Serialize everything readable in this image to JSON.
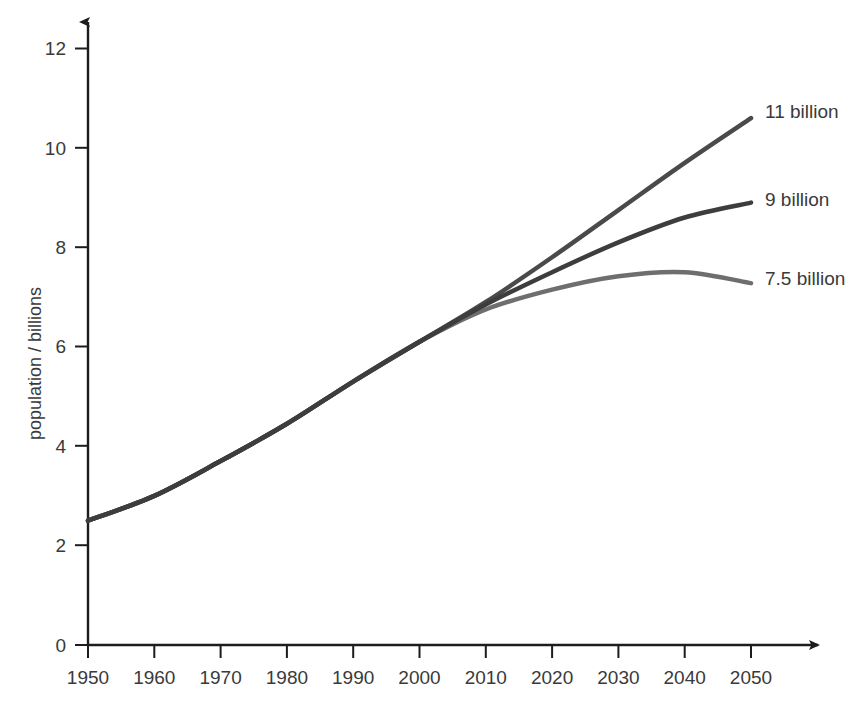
{
  "chart_data": {
    "type": "line",
    "title": "",
    "subtitle": "",
    "xlabel": "",
    "ylabel": "population / billions",
    "xlim": [
      1950,
      2050
    ],
    "ylim": [
      0,
      12
    ],
    "grid": false,
    "legend_position": "right-end-labels",
    "x_ticks": [
      "1950",
      "1960",
      "1970",
      "1980",
      "1990",
      "2000",
      "2010",
      "2020",
      "2030",
      "2040",
      "2050"
    ],
    "y_ticks": [
      "0",
      "2",
      "4",
      "6",
      "8",
      "10",
      "12"
    ],
    "x": [
      1950,
      1960,
      1970,
      1980,
      1990,
      2000,
      2010,
      2020,
      2030,
      2040,
      2050
    ],
    "series": [
      {
        "name": "11 billion",
        "label": "11 billion",
        "color": "#4a4a4a",
        "stroke_width": 4.5,
        "values": [
          2.5,
          3.0,
          3.7,
          4.45,
          5.3,
          6.1,
          6.9,
          7.8,
          8.75,
          9.7,
          10.6
        ]
      },
      {
        "name": "9 billion",
        "label": "9 billion",
        "color": "#3d3d3d",
        "stroke_width": 4.5,
        "values": [
          2.5,
          3.0,
          3.7,
          4.45,
          5.3,
          6.1,
          6.85,
          7.5,
          8.1,
          8.6,
          8.9
        ]
      },
      {
        "name": "7.5 billion",
        "label": "7.5 billion",
        "color": "#6e6e6e",
        "stroke_width": 4.5,
        "values": [
          2.5,
          3.0,
          3.7,
          4.45,
          5.3,
          6.1,
          6.75,
          7.15,
          7.42,
          7.5,
          7.28
        ]
      }
    ],
    "annotations": [
      {
        "text": "11 billion",
        "at_x": 2050,
        "at_y": 10.6
      },
      {
        "text": "9 billion",
        "at_x": 2050,
        "at_y": 8.9
      },
      {
        "text": "7.5 billion",
        "at_x": 2050,
        "at_y": 7.28
      }
    ],
    "colors": {
      "axis": "#1c1c1c",
      "text": "#3a3a3a",
      "background": "#ffffff",
      "series_high": "#4a4a4a",
      "series_mid": "#3d3d3d",
      "series_low": "#6e6e6e"
    }
  }
}
